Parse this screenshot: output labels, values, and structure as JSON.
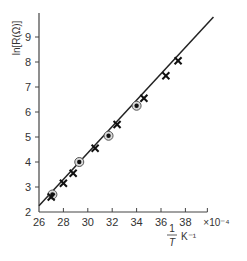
{
  "chart_data": {
    "type": "scatter",
    "title": "",
    "xlabel": "1/T K^-1",
    "xlabel_parts": {
      "numerator": "1",
      "denominator": "T",
      "unit": "K⁻¹"
    },
    "ylabel": "ln[R(Ω)]",
    "x_scale_note": "×10⁻⁴",
    "xlim": [
      26,
      40
    ],
    "ylim": [
      2,
      10
    ],
    "xticks": [
      26,
      28,
      30,
      32,
      34,
      36,
      38
    ],
    "yticks": [
      2,
      3,
      4,
      5,
      6,
      7,
      8,
      9
    ],
    "grid": false,
    "legend": null,
    "series": [
      {
        "name": "circles",
        "marker": "circle-dot",
        "points": [
          [
            27.1,
            2.7
          ],
          [
            29.3,
            4.0
          ],
          [
            31.7,
            5.05
          ],
          [
            34.0,
            6.25
          ]
        ]
      },
      {
        "name": "crosses",
        "marker": "cross",
        "points": [
          [
            27.0,
            2.6
          ],
          [
            28.0,
            3.15
          ],
          [
            28.8,
            3.55
          ],
          [
            30.6,
            4.55
          ],
          [
            32.4,
            5.5
          ],
          [
            34.6,
            6.55
          ],
          [
            36.4,
            7.45
          ],
          [
            37.4,
            8.05
          ]
        ]
      }
    ],
    "fit_line": {
      "x": [
        26.0,
        40.3
      ],
      "y": [
        2.25,
        9.8
      ]
    }
  }
}
